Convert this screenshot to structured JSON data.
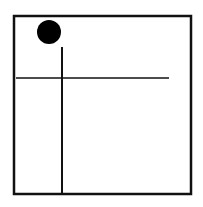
{
  "diagram": {
    "background": "#ffffff",
    "stroke_color": "#111111",
    "frame": {
      "x": 14,
      "y": 16,
      "width": 177,
      "height": 178,
      "stroke_width": 2.5
    },
    "circle": {
      "cx": 49,
      "cy": 32,
      "r": 12,
      "fill": "#000000"
    },
    "vertical_line": {
      "x1": 62,
      "y1": 47,
      "x2": 62,
      "y2": 194,
      "stroke_width": 2
    },
    "horizontal_line": {
      "x1": 16,
      "y1": 78,
      "x2": 169,
      "y2": 78,
      "stroke_width": 1.5
    }
  }
}
